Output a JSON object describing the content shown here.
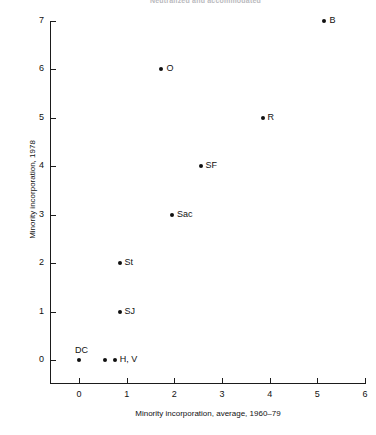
{
  "clipped_title": "Neutralized and accommodated",
  "chart_data": {
    "type": "scatter",
    "title": "",
    "xlabel": "Minority incorporation, average, 1960–79",
    "ylabel": "Minority incorporation, 1978",
    "xlim": [
      -0.6,
      6.0
    ],
    "ylim": [
      -0.55,
      7.0
    ],
    "xticks": [
      "0",
      "1",
      "2",
      "3",
      "4",
      "5",
      "6"
    ],
    "xtick_values": [
      0,
      1,
      2,
      3,
      4,
      5,
      6
    ],
    "yticks": [
      "0",
      "1",
      "2",
      "3",
      "4",
      "5",
      "6",
      "7"
    ],
    "ytick_values": [
      0,
      1,
      2,
      3,
      4,
      5,
      6,
      7
    ],
    "grid": false,
    "legend": "none",
    "marker_color": "#101010",
    "points": [
      {
        "label": "DC",
        "x": 0.0,
        "y": 0.0,
        "label_pos": "above"
      },
      {
        "label": "",
        "x": 0.55,
        "y": 0.0,
        "label_pos": "none"
      },
      {
        "label": "H, V",
        "x": 0.75,
        "y": 0.0,
        "label_pos": "right"
      },
      {
        "label": "SJ",
        "x": 0.85,
        "y": 1.0,
        "label_pos": "right"
      },
      {
        "label": "St",
        "x": 0.85,
        "y": 2.0,
        "label_pos": "right"
      },
      {
        "label": "Sac",
        "x": 1.95,
        "y": 3.0,
        "label_pos": "right"
      },
      {
        "label": "SF",
        "x": 2.55,
        "y": 4.0,
        "label_pos": "right"
      },
      {
        "label": "O",
        "x": 1.73,
        "y": 6.0,
        "label_pos": "right"
      },
      {
        "label": "R",
        "x": 3.85,
        "y": 5.0,
        "label_pos": "right"
      },
      {
        "label": "B",
        "x": 5.15,
        "y": 7.0,
        "label_pos": "right"
      }
    ]
  }
}
